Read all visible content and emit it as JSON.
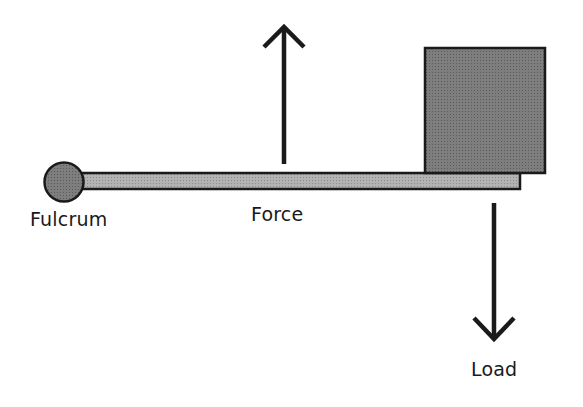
{
  "diagram": {
    "labels": {
      "fulcrum": "Fulcrum",
      "force": "Force",
      "load": "Load"
    },
    "colors": {
      "bar_fill": "#a9a9a9",
      "box_fill": "#7a7a7a",
      "fulcrum_fill": "#707070",
      "stroke": "#1a1a1a"
    }
  }
}
